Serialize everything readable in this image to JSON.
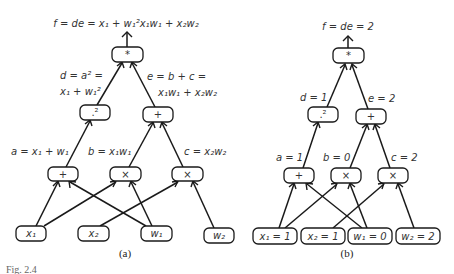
{
  "panel_a": {
    "caption": "(a)",
    "output_label": "f = de = x₁ + w₁²x₁w₁ + x₂w₂",
    "edge_labels": {
      "d_line1": "d = a² =",
      "d_line2": "x₁ + w₁²",
      "e_line1": "e = b + c =",
      "e_line2": "x₁w₁ + x₂w₂",
      "a": "a = x₁ + w₁",
      "b": "b = x₁w₁",
      "c": "c = x₂w₂"
    },
    "nodes": {
      "mul_top": "*",
      "square": ".²",
      "add_e": "+",
      "add_a": "+",
      "mul_b": "×",
      "mul_c": "×",
      "x1": "x₁",
      "x2": "x₂",
      "w1": "w₁",
      "w2": "w₂"
    }
  },
  "panel_b": {
    "caption": "(b)",
    "output_label": "f = de = 2",
    "edge_labels": {
      "d": "d = 1",
      "e": "e = 2",
      "a": "a = 1",
      "b": "b = 0",
      "c": "c = 2"
    },
    "nodes": {
      "mul_top": "*",
      "square": ".²",
      "add_e": "+",
      "add_a": "+",
      "mul_b": "×",
      "mul_c": "×",
      "x1": "x₁ = 1",
      "x2": "x₂ = 1",
      "w1": "w₁ = 0",
      "w2": "w₂ = 2"
    }
  },
  "figure_caption": "Fig. 2.4"
}
